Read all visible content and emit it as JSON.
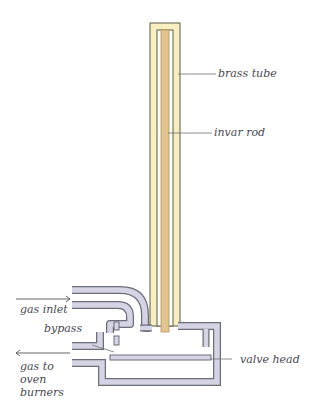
{
  "diagram": {
    "type": "thermostat valve cross-section",
    "colors": {
      "brass_tube_fill": "#f7efc0",
      "brass_tube_stroke": "#5a5a48",
      "invar_rod_fill": "#e2c48e",
      "invar_rod_stroke": "#b8945a",
      "pipe_fill": "#d4d4e4",
      "pipe_stroke": "#6c6c7a",
      "leader_line": "#707070",
      "label_text": "#4a4a52"
    },
    "labels": {
      "brass_tube": "brass tube",
      "invar_rod": "invar rod",
      "gas_inlet": "gas inlet",
      "bypass": "bypass",
      "gas_to_oven_burners": "gas to oven burners",
      "valve_head": "valve head"
    },
    "arrows": [
      {
        "name": "gas-inlet-arrow",
        "direction": "right"
      },
      {
        "name": "gas-outlet-arrow",
        "direction": "left"
      }
    ]
  }
}
